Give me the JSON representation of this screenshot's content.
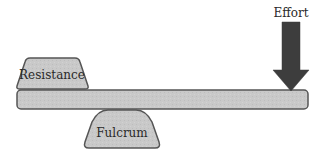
{
  "diagram": {
    "type": "lever",
    "labels": {
      "effort": "Effort",
      "resistance": "Resistance",
      "fulcrum": "Fulcrum"
    },
    "colors": {
      "fill": "#c8c8c8",
      "stroke": "#555555",
      "arrow": "#3d3d3d",
      "text": "#2a2a2a"
    }
  }
}
